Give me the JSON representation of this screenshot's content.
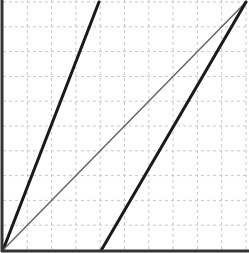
{
  "chart_data": {
    "type": "line",
    "title": "",
    "xlabel": "",
    "ylabel": "",
    "xlim": [
      0,
      10
    ],
    "ylim": [
      0,
      10
    ],
    "grid": true,
    "grid_style": "dashed",
    "grid_color": "#c8c8c8",
    "x_ticks": [
      0,
      1,
      2,
      3,
      4,
      5,
      6,
      7,
      8,
      9,
      10
    ],
    "y_ticks": [
      0,
      1,
      2,
      3,
      4,
      5,
      6,
      7,
      8,
      9,
      10
    ],
    "tick_labels_visible": false,
    "legend": [],
    "series": [
      {
        "name": "steep-line",
        "color": "#1a1a1a",
        "width": 3,
        "x": [
          0,
          3.95
        ],
        "y": [
          0,
          10
        ]
      },
      {
        "name": "diagonal-line",
        "color": "#666666",
        "width": 1.5,
        "x": [
          0,
          10
        ],
        "y": [
          0,
          10
        ]
      },
      {
        "name": "shifted-line",
        "color": "#1a1a1a",
        "width": 3,
        "x": [
          4.05,
          10
        ],
        "y": [
          0,
          10
        ]
      }
    ]
  },
  "layout": {
    "plot_left": 3,
    "plot_right": 246,
    "plot_top": 2,
    "plot_bottom": 250
  }
}
